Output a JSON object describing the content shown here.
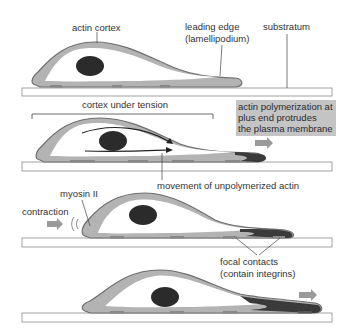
{
  "diagram": {
    "colors": {
      "cortex_light": "#b3b3b3",
      "cortex_outline": "#6e6e6e",
      "nucleus": "#2b2b2b",
      "cytoplasm": "#ffffff",
      "substratum_fill": "#ffffff",
      "substratum_stroke": "#8a8a8a",
      "dark_actin": "#3a3a3a",
      "arrow": "#9a9a9a",
      "highlight_box": "#c4c4c4"
    },
    "panels": [
      {
        "id": "panel-1",
        "labels": {
          "actin_cortex": "actin cortex",
          "leading_edge_line1": "leading edge",
          "leading_edge_line2": "(lamellipodium)",
          "substratum": "substratum"
        }
      },
      {
        "id": "panel-2",
        "labels": {
          "cortex_under_tension": "cortex under tension",
          "polymerization_line1": "actin polymerization at",
          "polymerization_line2": "plus end protrudes",
          "polymerization_line3": "the plasma membrane",
          "movement": "movement of unpolymerized actin"
        }
      },
      {
        "id": "panel-3",
        "labels": {
          "myosin": "myosin II",
          "contraction": "contraction",
          "focal_contacts_line1": "focal contacts",
          "focal_contacts_line2": "(contain integrins)"
        }
      },
      {
        "id": "panel-4",
        "labels": {}
      }
    ]
  }
}
